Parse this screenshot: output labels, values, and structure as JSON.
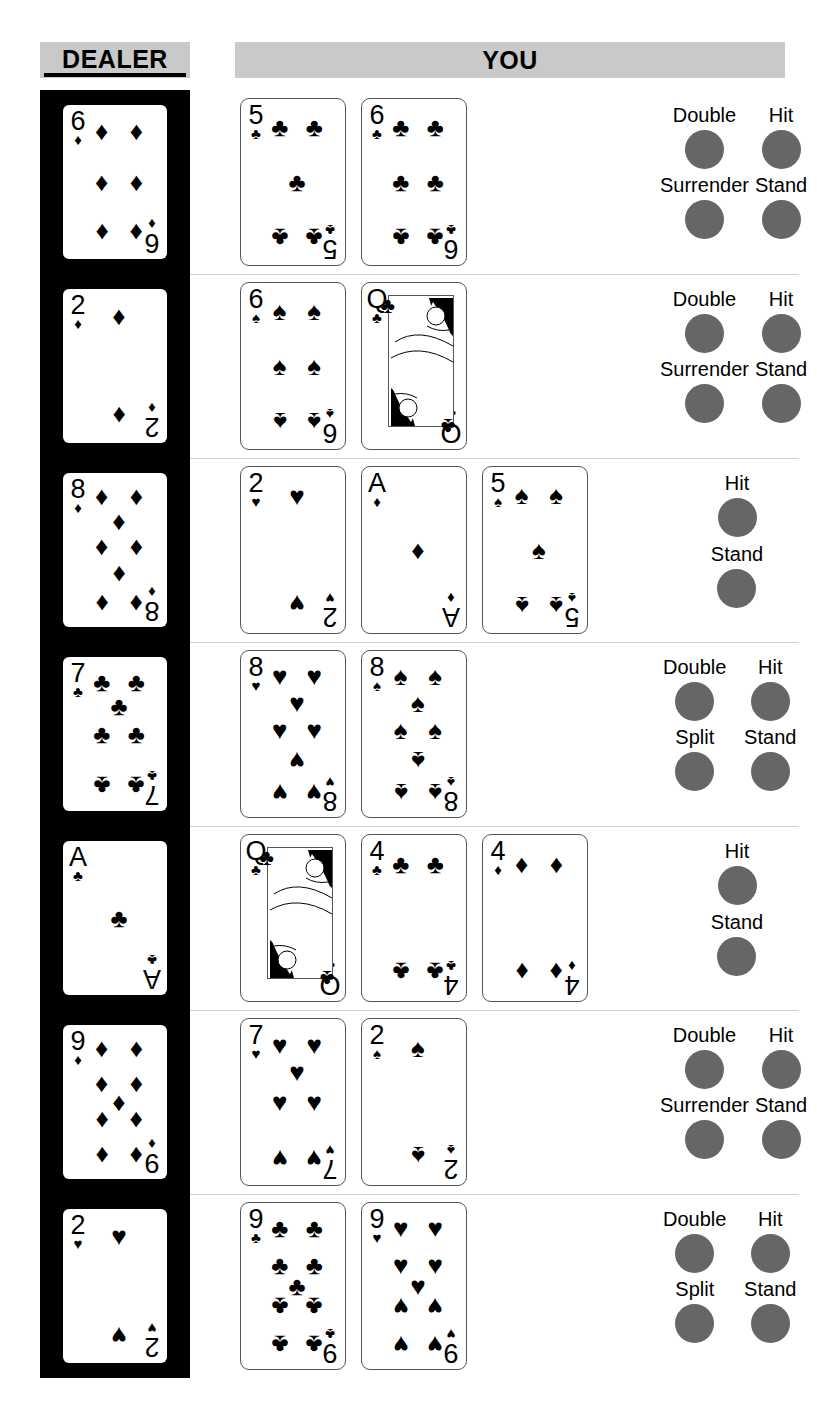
{
  "header": {
    "dealer_label": "DEALER",
    "you_label": "YOU"
  },
  "colors": {
    "header_bar": "#c9c9c9",
    "dealer_panel": "#000000",
    "button_dot": "#666666",
    "card_border": "#555555",
    "row_separator": "#d0d0d0"
  },
  "suits": {
    "spade": "♠",
    "heart": "♥",
    "diamond": "♦",
    "club": "♣"
  },
  "rows": [
    {
      "dealer": {
        "rank": "6",
        "suit": "diamond"
      },
      "player": [
        {
          "rank": "5",
          "suit": "club"
        },
        {
          "rank": "6",
          "suit": "club"
        }
      ],
      "actions": [
        "Double",
        "Hit",
        "Surrender",
        "Stand"
      ],
      "layout": "two-col"
    },
    {
      "dealer": {
        "rank": "2",
        "suit": "diamond"
      },
      "player": [
        {
          "rank": "6",
          "suit": "spade"
        },
        {
          "rank": "Q",
          "suit": "club"
        }
      ],
      "actions": [
        "Double",
        "Hit",
        "Surrender",
        "Stand"
      ],
      "layout": "two-col"
    },
    {
      "dealer": {
        "rank": "8",
        "suit": "diamond"
      },
      "player": [
        {
          "rank": "2",
          "suit": "heart"
        },
        {
          "rank": "A",
          "suit": "diamond"
        },
        {
          "rank": "5",
          "suit": "spade"
        }
      ],
      "actions": [
        "Hit",
        "Stand"
      ],
      "layout": "one-col"
    },
    {
      "dealer": {
        "rank": "7",
        "suit": "club"
      },
      "player": [
        {
          "rank": "8",
          "suit": "heart"
        },
        {
          "rank": "8",
          "suit": "spade"
        }
      ],
      "actions": [
        "Double",
        "Hit",
        "Split",
        "Stand"
      ],
      "layout": "two-col"
    },
    {
      "dealer": {
        "rank": "A",
        "suit": "club"
      },
      "player": [
        {
          "rank": "Q",
          "suit": "club"
        },
        {
          "rank": "4",
          "suit": "club"
        },
        {
          "rank": "4",
          "suit": "diamond"
        }
      ],
      "actions": [
        "Hit",
        "Stand"
      ],
      "layout": "one-col"
    },
    {
      "dealer": {
        "rank": "9",
        "suit": "diamond"
      },
      "player": [
        {
          "rank": "7",
          "suit": "heart"
        },
        {
          "rank": "2",
          "suit": "spade"
        }
      ],
      "actions": [
        "Double",
        "Hit",
        "Surrender",
        "Stand"
      ],
      "layout": "two-col"
    },
    {
      "dealer": {
        "rank": "2",
        "suit": "heart"
      },
      "player": [
        {
          "rank": "9",
          "suit": "club"
        },
        {
          "rank": "9",
          "suit": "heart"
        }
      ],
      "actions": [
        "Double",
        "Hit",
        "Split",
        "Stand"
      ],
      "layout": "two-col"
    }
  ]
}
